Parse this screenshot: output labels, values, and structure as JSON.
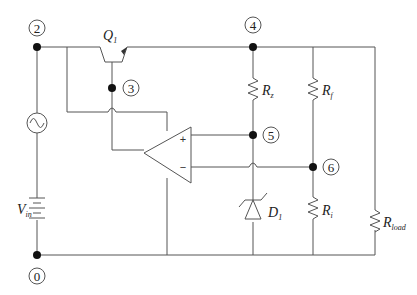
{
  "diagram": {
    "type": "circuit-schematic",
    "nodes": [
      {
        "id": "0",
        "label": "0",
        "x": 37,
        "y": 255,
        "label_x": 37,
        "label_y": 276
      },
      {
        "id": "2",
        "label": "2",
        "x": 37,
        "y": 47,
        "label_x": 37,
        "label_y": 28
      },
      {
        "id": "3",
        "label": "3",
        "x": 112,
        "y": 88,
        "label_x": 131,
        "label_y": 88
      },
      {
        "id": "4",
        "label": "4",
        "x": 253,
        "y": 47,
        "label_x": 253,
        "label_y": 25
      },
      {
        "id": "5",
        "label": "5",
        "x": 253,
        "y": 135,
        "label_x": 271,
        "label_y": 135
      },
      {
        "id": "6",
        "label": "6",
        "x": 313,
        "y": 167,
        "label_x": 331,
        "label_y": 167
      }
    ],
    "components": {
      "q1": {
        "name": "Q",
        "sub": "1",
        "type": "npn-transistor"
      },
      "rz": {
        "name": "R",
        "sub": "z",
        "type": "resistor"
      },
      "rf": {
        "name": "R",
        "sub": "f",
        "type": "resistor"
      },
      "ri": {
        "name": "R",
        "sub": "i",
        "type": "resistor"
      },
      "rload": {
        "name": "R",
        "sub": "load",
        "type": "resistor"
      },
      "d1": {
        "name": "D",
        "sub": "1",
        "type": "zener-diode"
      },
      "vin": {
        "name": "V",
        "sub": "in",
        "type": "dc-battery"
      },
      "ac": {
        "name": "",
        "type": "ac-source-icon"
      },
      "opamp": {
        "type": "op-amp",
        "plus": "+",
        "minus": "−"
      }
    },
    "colors": {
      "wire": "#555555",
      "node_dot": "#111111",
      "text": "#222222"
    }
  }
}
